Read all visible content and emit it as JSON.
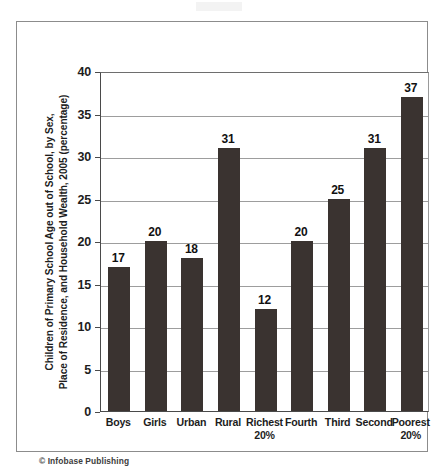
{
  "figure": {
    "copyright": "© Infobase Publishing"
  },
  "chart_data": {
    "type": "bar",
    "title": "",
    "xlabel": "",
    "ylabel": "Children of Primary School Age out of School, by Sex, Place of Residence, and Household Wealth, 2005 (percentage)",
    "ylabel_lines": [
      "Children of Primary School Age out of School, by Sex,",
      "Place of Residence, and Household Wealth, 2005 (percentage)"
    ],
    "categories": [
      "Boys",
      "Girls",
      "Urban",
      "Rural",
      "Richest 20%",
      "Fourth",
      "Third",
      "Second",
      "Poorest 20%"
    ],
    "category_lines": [
      [
        "Boys"
      ],
      [
        "Girls"
      ],
      [
        "Urban"
      ],
      [
        "Rural"
      ],
      [
        "Richest",
        "20%"
      ],
      [
        "Fourth"
      ],
      [
        "Third"
      ],
      [
        "Second"
      ],
      [
        "Poorest",
        "20%"
      ]
    ],
    "values": [
      17,
      20,
      18,
      31,
      12,
      20,
      25,
      31,
      37
    ],
    "value_labels": [
      "17",
      "20",
      "18",
      "31",
      "12",
      "20",
      "25",
      "31",
      "37"
    ],
    "ylim": [
      0,
      40
    ],
    "ytick_values": [
      0,
      5,
      10,
      15,
      20,
      25,
      30,
      35,
      40
    ],
    "ytick_labels": [
      "0",
      "5",
      "10",
      "15",
      "20",
      "25",
      "30",
      "35",
      "40"
    ],
    "grid": true,
    "grid_axis": "y",
    "legend": false,
    "legend_position": "none",
    "bar_color": "#3a3330",
    "grid_color": "#9d9d9d",
    "axis_color": "#4a4a4a",
    "background_color": "#ffffff",
    "units": "percentage"
  }
}
